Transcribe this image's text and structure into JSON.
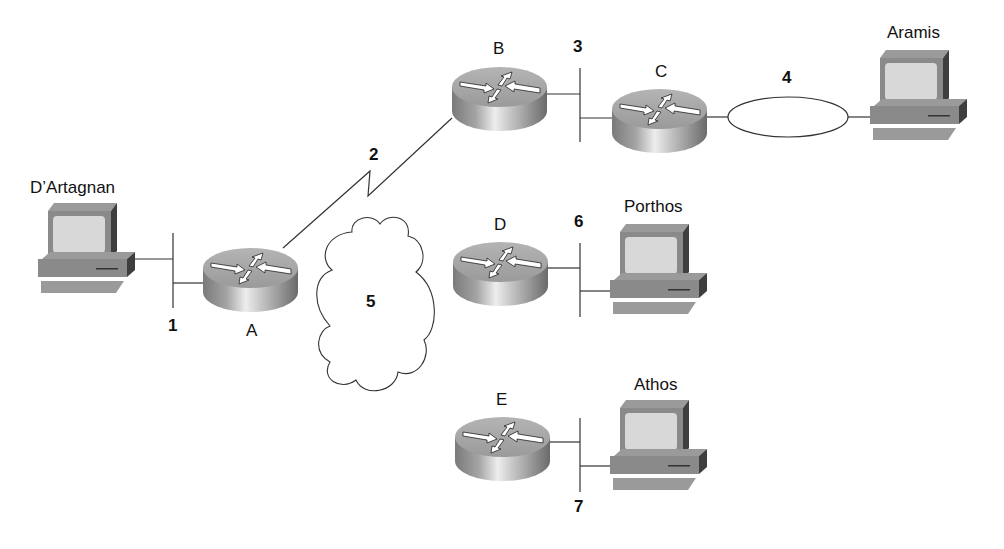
{
  "diagram": {
    "type": "network-topology",
    "hosts": [
      {
        "id": "dartagnan",
        "label": "D’Artagnan",
        "x": 38,
        "y": 200,
        "label_x": 30,
        "label_y": 179
      },
      {
        "id": "aramis",
        "label": "Aramis",
        "x": 870,
        "y": 48,
        "label_x": 887,
        "label_y": 24
      },
      {
        "id": "porthos",
        "label": "Porthos",
        "x": 610,
        "y": 221,
        "label_x": 624,
        "label_y": 198
      },
      {
        "id": "athos",
        "label": "Athos",
        "x": 610,
        "y": 398,
        "label_x": 634,
        "label_y": 376
      }
    ],
    "routers": [
      {
        "id": "A",
        "label": "A",
        "x": 203,
        "y": 248,
        "label_x": 246,
        "label_y": 322
      },
      {
        "id": "B",
        "label": "B",
        "x": 452,
        "y": 67,
        "label_x": 493,
        "label_y": 40
      },
      {
        "id": "C",
        "label": "C",
        "x": 612,
        "y": 89,
        "label_x": 655,
        "label_y": 63
      },
      {
        "id": "D",
        "label": "D",
        "x": 453,
        "y": 242,
        "label_x": 494,
        "label_y": 216
      },
      {
        "id": "E",
        "label": "E",
        "x": 455,
        "y": 417,
        "label_x": 496,
        "label_y": 391
      }
    ],
    "segments": [
      {
        "id": "1",
        "label": "1",
        "type": "ethernet",
        "label_x": 168,
        "label_y": 317
      },
      {
        "id": "2",
        "label": "2",
        "type": "serial",
        "label_x": 369,
        "label_y": 146
      },
      {
        "id": "3",
        "label": "3",
        "type": "ethernet",
        "label_x": 573,
        "label_y": 38
      },
      {
        "id": "4",
        "label": "4",
        "type": "token-ring",
        "label_x": 782,
        "label_y": 69
      },
      {
        "id": "5",
        "label": "5",
        "type": "cloud",
        "label_x": 366,
        "label_y": 293
      },
      {
        "id": "6",
        "label": "6",
        "type": "ethernet",
        "label_x": 574,
        "label_y": 213
      },
      {
        "id": "7",
        "label": "7",
        "type": "ethernet",
        "label_x": 574,
        "label_y": 498
      }
    ],
    "colors": {
      "line": "#333333",
      "router_top": "#a8a8a8",
      "router_side_dark": "#6e6e6e",
      "router_side_light": "#e4e4e4",
      "pc_body": "#8c8c8c",
      "pc_dark": "#4a4a4a",
      "pc_screen": "#d6d6d6"
    }
  }
}
